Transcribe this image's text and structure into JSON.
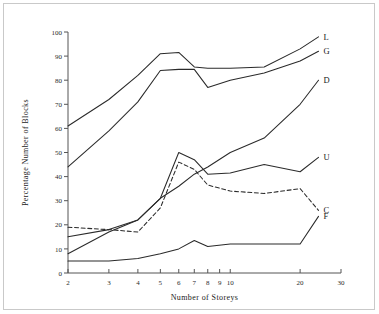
{
  "figure": {
    "border_color": "#c9c9c9",
    "background": "#ffffff"
  },
  "chart_data": {
    "type": "line",
    "title": "",
    "xlabel": "Number of Storeys",
    "ylabel": "Percentage Number of Blocks",
    "xscale": "log",
    "yscale": "linear",
    "xlim": [
      2,
      30
    ],
    "ylim": [
      0,
      100
    ],
    "grid": false,
    "legend_position": "right-inline-labels",
    "xticks": [
      2,
      3,
      4,
      5,
      6,
      7,
      8,
      9,
      10,
      20,
      30
    ],
    "xtick_labels": [
      "2",
      "3",
      "4",
      "5",
      "6",
      "7",
      "8",
      "9",
      "10",
      "20",
      "30"
    ],
    "yticks": [
      0,
      10,
      20,
      30,
      40,
      50,
      60,
      70,
      80,
      90,
      100
    ],
    "ytick_labels": [
      "0",
      "10",
      "20",
      "30",
      "40",
      "50",
      "60",
      "70",
      "80",
      "90",
      "100"
    ],
    "series": [
      {
        "name": "L",
        "label": "L",
        "style": "solid",
        "x": [
          2,
          3,
          4,
          5,
          6,
          7,
          8,
          10,
          14,
          20,
          24
        ],
        "values": [
          61,
          72,
          82,
          91,
          91.5,
          85.5,
          85,
          85,
          85.5,
          93,
          98
        ]
      },
      {
        "name": "G",
        "label": "G",
        "style": "solid",
        "x": [
          2,
          3,
          4,
          5,
          6,
          7,
          8,
          10,
          14,
          20,
          24
        ],
        "values": [
          44,
          59,
          71,
          84,
          84.5,
          84.5,
          77,
          80,
          83,
          88,
          92
        ]
      },
      {
        "name": "D",
        "label": "D",
        "style": "solid",
        "x": [
          2,
          3,
          4,
          5,
          6,
          7,
          8,
          10,
          14,
          20,
          24
        ],
        "values": [
          8,
          17,
          22,
          31,
          36,
          41,
          44,
          50,
          56,
          70,
          80
        ]
      },
      {
        "name": "U",
        "label": "U",
        "style": "solid",
        "x": [
          2,
          3,
          4,
          5,
          6,
          7,
          8,
          10,
          14,
          20,
          24
        ],
        "values": [
          15,
          18,
          22,
          31,
          50,
          47,
          41,
          41.5,
          45,
          42,
          48
        ]
      },
      {
        "name": "C",
        "label": "C",
        "style": "dashed",
        "x": [
          2,
          3,
          4,
          5,
          6,
          7,
          8,
          10,
          14,
          20,
          24
        ],
        "values": [
          19,
          18,
          17,
          27,
          46,
          43,
          36.5,
          34,
          33,
          35,
          26
        ]
      },
      {
        "name": "F",
        "label": "F",
        "style": "solid",
        "x": [
          2,
          3,
          4,
          5,
          6,
          7,
          8,
          10,
          14,
          20,
          24
        ],
        "values": [
          5,
          5,
          6,
          8,
          10,
          13.5,
          11,
          12,
          12,
          12,
          23.5
        ]
      }
    ]
  }
}
